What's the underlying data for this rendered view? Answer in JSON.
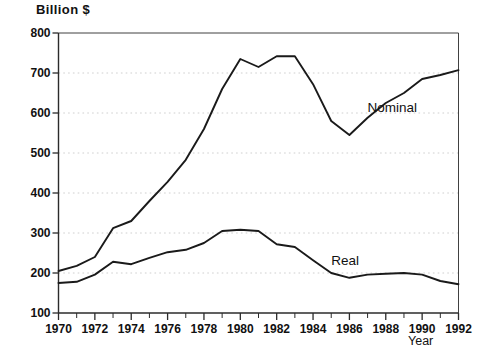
{
  "chart_data": {
    "type": "line",
    "title": "Billion $",
    "xlabel": "Year",
    "ylabel": "Billion $",
    "grid": true,
    "legend_position": "inline-annotation",
    "xlim": [
      1970,
      1992
    ],
    "ylim": [
      100,
      800
    ],
    "ytick_values": [
      100,
      200,
      300,
      400,
      500,
      600,
      700,
      800
    ],
    "ytick_labels": [
      "100",
      "200",
      "300",
      "400",
      "500",
      "600",
      "700",
      "800"
    ],
    "xtick_values": [
      1970,
      1972,
      1974,
      1976,
      1978,
      1980,
      1982,
      1984,
      1986,
      1988,
      1990,
      1992
    ],
    "xtick_labels": [
      "1970",
      "1972",
      "1974",
      "1976",
      "1978",
      "1980",
      "1982",
      "1984",
      "1986",
      "1988",
      "1990",
      "1992"
    ],
    "x_minor_ticks_every": 1,
    "x": [
      1970,
      1971,
      1972,
      1973,
      1974,
      1975,
      1976,
      1977,
      1978,
      1979,
      1980,
      1981,
      1982,
      1983,
      1984,
      1985,
      1986,
      1987,
      1988,
      1989,
      1990,
      1991,
      1992
    ],
    "series": [
      {
        "name": "Nominal",
        "color": "#1a1a1a",
        "label_x": 1987.0,
        "label_y": 610,
        "values": [
          205,
          218,
          240,
          312,
          330,
          380,
          428,
          483,
          560,
          660,
          735,
          715,
          742,
          742,
          672,
          580,
          545,
          588,
          625,
          650,
          685,
          695,
          707
        ]
      },
      {
        "name": "Real",
        "color": "#1a1a1a",
        "label_x": 1985.0,
        "label_y": 228,
        "values": [
          175,
          178,
          196,
          228,
          222,
          238,
          252,
          258,
          275,
          305,
          308,
          305,
          272,
          265,
          232,
          200,
          188,
          196,
          198,
          200,
          196,
          180,
          172
        ]
      }
    ]
  },
  "axes": {
    "y_axis_name": "y-axis",
    "x_axis_name": "x-axis"
  }
}
